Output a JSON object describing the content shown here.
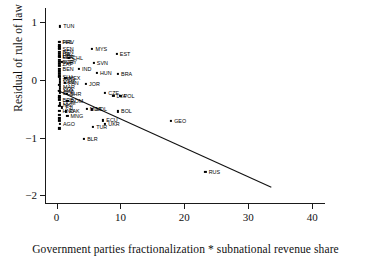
{
  "chart_data": {
    "type": "scatter",
    "title": "",
    "xlabel": "Government parties fractionalization * subnational revenue share",
    "ylabel": "Residual of rule of law",
    "xlim": [
      -1.8,
      42
    ],
    "ylim": [
      -2.15,
      1.25
    ],
    "xticks": [
      0,
      10,
      20,
      30,
      40
    ],
    "xtick_labels": [
      "0",
      "10",
      "20",
      "30",
      "40"
    ],
    "yticks": [
      1,
      0,
      -1,
      -2
    ],
    "ytick_labels": [
      "1",
      "0",
      "−1",
      "−2"
    ],
    "grid": false,
    "legend": null,
    "marker": "filled-square",
    "fit_line": {
      "type": "linear-regression",
      "x_start": 0.2,
      "y_start": -0.18,
      "x_end": 33.6,
      "y_end": -1.86
    },
    "points": [
      {
        "label": "TUN",
        "x": 0.55,
        "y": 0.93
      },
      {
        "label": "HRV",
        "x": 0.5,
        "y": 0.66
      },
      {
        "label": "PHL",
        "x": 0.4,
        "y": 0.655
      },
      {
        "label": "SEN",
        "x": 0.45,
        "y": 0.535
      },
      {
        "label": "BEN",
        "x": 0.45,
        "y": 0.495
      },
      {
        "label": "ITA",
        "x": 0.45,
        "y": 0.46
      },
      {
        "label": "LTU",
        "x": 0.45,
        "y": 0.425
      },
      {
        "label": "PER",
        "x": 0.45,
        "y": 0.4
      },
      {
        "label": "GRC",
        "x": 0.5,
        "y": 0.395
      },
      {
        "label": "CHL",
        "x": 1.95,
        "y": 0.385
      },
      {
        "label": "MYS",
        "x": 5.6,
        "y": 0.545
      },
      {
        "label": "EST",
        "x": 9.4,
        "y": 0.46
      },
      {
        "label": "URY",
        "x": 0.9,
        "y": 0.31
      },
      {
        "label": "BGR",
        "x": 0.45,
        "y": 0.315
      },
      {
        "label": "ZAF",
        "x": 0.45,
        "y": 0.285
      },
      {
        "label": "SVN",
        "x": 5.8,
        "y": 0.3
      },
      {
        "label": "BEN2",
        "x": 0.45,
        "y": 0.195
      },
      {
        "label": "IND",
        "x": 3.5,
        "y": 0.19
      },
      {
        "label": "HUN",
        "x": 6.3,
        "y": 0.125
      },
      {
        "label": "BRA",
        "x": 9.6,
        "y": 0.105
      },
      {
        "label": "SLV",
        "x": 0.45,
        "y": 0.055
      },
      {
        "label": "MEX",
        "x": 1.4,
        "y": 0.04
      },
      {
        "label": "ARG",
        "x": 0.5,
        "y": 0.01
      },
      {
        "label": "NAM",
        "x": 0.5,
        "y": -0.04
      },
      {
        "label": "PAN",
        "x": 1.3,
        "y": -0.055
      },
      {
        "label": "JOR",
        "x": 4.6,
        "y": -0.06
      },
      {
        "label": "MAR",
        "x": 0.5,
        "y": -0.115
      },
      {
        "label": "COL",
        "x": 0.5,
        "y": -0.155
      },
      {
        "label": "JAM",
        "x": 0.45,
        "y": -0.185
      },
      {
        "label": "ECU",
        "x": 0.5,
        "y": -0.22
      },
      {
        "label": "BHR",
        "x": 1.6,
        "y": -0.245
      },
      {
        "label": "CZE",
        "x": 7.6,
        "y": -0.225
      },
      {
        "label": "LVA",
        "x": 8.9,
        "y": -0.275
      },
      {
        "label": "POL",
        "x": 10.0,
        "y": -0.27
      },
      {
        "label": "BRB",
        "x": 0.45,
        "y": -0.345
      },
      {
        "label": "ROM",
        "x": 1.7,
        "y": -0.355
      },
      {
        "label": "DOM",
        "x": 0.5,
        "y": -0.4
      },
      {
        "label": "NIC",
        "x": 0.5,
        "y": -0.425
      },
      {
        "label": "FJI",
        "x": 0.9,
        "y": -0.475
      },
      {
        "label": "MDA",
        "x": 4.7,
        "y": -0.5
      },
      {
        "label": "MDL",
        "x": 5.6,
        "y": -0.51
      },
      {
        "label": "BOL",
        "x": 9.6,
        "y": -0.545
      },
      {
        "label": "HND",
        "x": 0.45,
        "y": -0.535
      },
      {
        "label": "PAK",
        "x": 1.5,
        "y": -0.545
      },
      {
        "label": "MNG",
        "x": 1.7,
        "y": -0.625
      },
      {
        "label": "ECU2",
        "x": 7.3,
        "y": -0.7
      },
      {
        "label": "UKR",
        "x": 7.6,
        "y": -0.765
      },
      {
        "label": "GEO",
        "x": 17.9,
        "y": -0.715
      },
      {
        "label": "TUR",
        "x": 5.7,
        "y": -0.815
      },
      {
        "label": "AGO",
        "x": 0.5,
        "y": -0.765
      },
      {
        "label": "BLR",
        "x": 4.3,
        "y": -1.02
      },
      {
        "label": "RUS",
        "x": 23.3,
        "y": -1.6
      }
    ],
    "hidden_cluster_points": [
      {
        "x": 0.45,
        "y": 0.6
      },
      {
        "x": 0.45,
        "y": 0.565
      },
      {
        "x": 0.45,
        "y": 0.345
      },
      {
        "x": 0.45,
        "y": 0.245
      },
      {
        "x": 0.45,
        "y": 0.15
      },
      {
        "x": 0.45,
        "y": 0.105
      },
      {
        "x": 0.45,
        "y": 0.075
      },
      {
        "x": 0.45,
        "y": -0.085
      },
      {
        "x": 0.45,
        "y": -0.285
      },
      {
        "x": 0.45,
        "y": -0.315
      },
      {
        "x": 0.45,
        "y": -0.455
      },
      {
        "x": 0.45,
        "y": -0.6
      },
      {
        "x": 0.45,
        "y": -0.665
      },
      {
        "x": 0.45,
        "y": -0.705
      },
      {
        "x": 0.45,
        "y": -0.84
      }
    ]
  }
}
